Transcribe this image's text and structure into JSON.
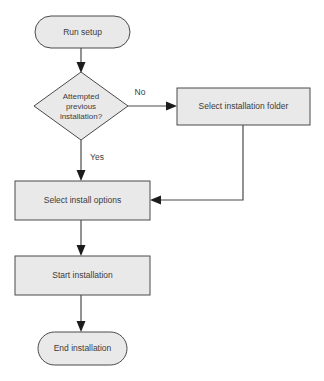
{
  "diagram": {
    "type": "flowchart",
    "background_color": "#ffffff",
    "node_fill_color": "#e9e9e9",
    "node_stroke_color": "#4a4a4a",
    "text_color": "#3c3c3c",
    "arrow_color": "#1c1c1c",
    "nodes": [
      {
        "id": "start",
        "shape": "terminator",
        "label": "Run setup"
      },
      {
        "id": "decision",
        "shape": "diamond",
        "label": "Attempted previous installation?",
        "line1": "Attempted",
        "line2": "previous",
        "line3": "installation?"
      },
      {
        "id": "select-folder",
        "shape": "process",
        "label": "Select installation folder"
      },
      {
        "id": "select-options",
        "shape": "process",
        "label": "Select install options"
      },
      {
        "id": "start-install",
        "shape": "process",
        "label": "Start installation"
      },
      {
        "id": "end",
        "shape": "terminator",
        "label": "End installation"
      }
    ],
    "edges": [
      {
        "id": "e1",
        "from": "start",
        "to": "decision",
        "label": ""
      },
      {
        "id": "e2",
        "from": "decision",
        "to": "select-folder",
        "label": "No"
      },
      {
        "id": "e3",
        "from": "decision",
        "to": "select-options",
        "label": "Yes"
      },
      {
        "id": "e4",
        "from": "select-folder",
        "to": "select-options",
        "label": ""
      },
      {
        "id": "e5",
        "from": "select-options",
        "to": "start-install",
        "label": ""
      },
      {
        "id": "e6",
        "from": "start-install",
        "to": "end",
        "label": ""
      }
    ]
  }
}
